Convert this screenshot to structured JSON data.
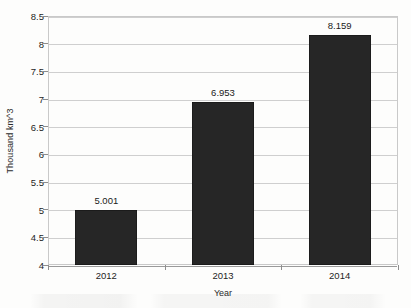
{
  "chart_data": {
    "type": "bar",
    "title": "",
    "subtitle": "",
    "xlabel": "Year",
    "ylabel": "Thousand km^3",
    "categories": [
      "2012",
      "2013",
      "2014"
    ],
    "values": [
      5.001,
      6.953,
      8.159
    ],
    "data_labels": [
      "5.001",
      "6.953",
      "8.159"
    ],
    "ylim": [
      4,
      8.5
    ],
    "ytick_step": 0.5,
    "ytick_labels": [
      "8.5",
      "8",
      "7.5",
      "7",
      "6.5",
      "6",
      "5.5",
      "5",
      "4.5",
      "4"
    ],
    "ytick_values": [
      8.5,
      8,
      7.5,
      7,
      6.5,
      6,
      5.5,
      5,
      4.5,
      4
    ],
    "grid": true,
    "grid_axis": "y",
    "legend": false,
    "legend_position": "none",
    "series": [
      {
        "name": "Thousand km^3",
        "values": [
          5.001,
          6.953,
          8.159
        ]
      }
    ]
  },
  "style": {
    "bar_color": "#262626",
    "plot_background": "#fdfdfc",
    "gridline_color": "#cfcfcf",
    "frame_color": "#c9c9c9",
    "text_color": "#1d1d1d"
  }
}
